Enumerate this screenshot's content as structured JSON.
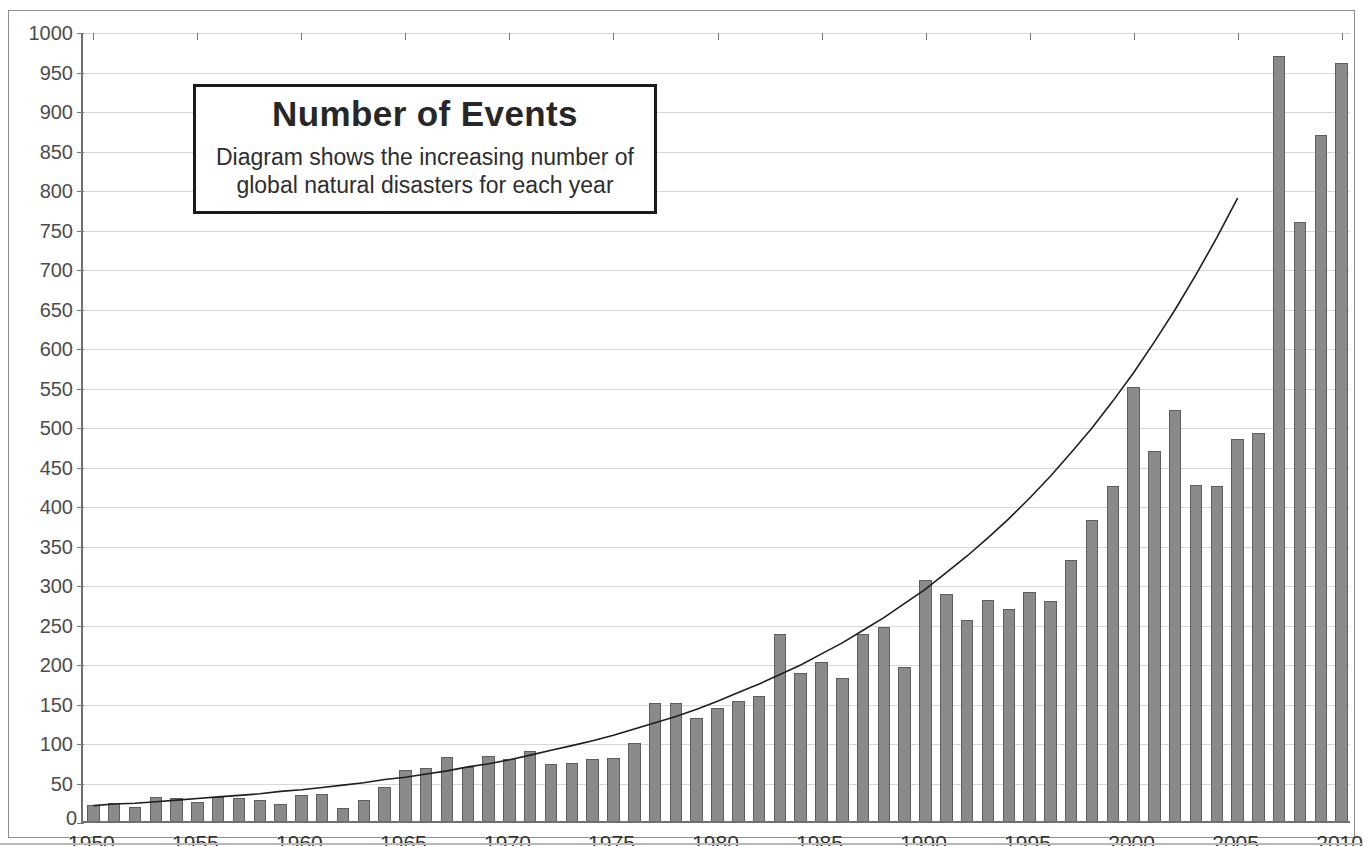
{
  "top_strip": {
    "clipped_text": ""
  },
  "title_box": {
    "title": "Number of Events",
    "subtitle_line1": "Diagram shows the increasing number of",
    "subtitle_line2": "global natural disasters for each year"
  },
  "colors": {
    "bar_fill": "#8a8a8a",
    "bar_edge": "#5e5e5e",
    "gridline": "#d8d8d8",
    "axis": "#6f6f6f",
    "trend_line": "#1e1e1e",
    "title_border": "#1b1b1b",
    "background": "#ffffff"
  },
  "chart_data": {
    "type": "bar",
    "title": "Number of Events",
    "subtitle": "Diagram shows the increasing number of global natural disasters for each year",
    "xlabel": "",
    "ylabel": "",
    "ylim": [
      0,
      1000
    ],
    "ytick_step": 50,
    "ytick_labels": [
      "0",
      "50",
      "100",
      "150",
      "200",
      "250",
      "300",
      "350",
      "400",
      "450",
      "500",
      "550",
      "600",
      "650",
      "700",
      "750",
      "800",
      "850",
      "900",
      "950",
      "1000"
    ],
    "xlim": [
      1950,
      2010
    ],
    "xtick_labels": [
      "1950",
      "1955",
      "1960",
      "1965",
      "1970",
      "1975",
      "1980",
      "1985",
      "1990",
      "1995",
      "2000",
      "2005",
      "2010"
    ],
    "xtick_step": 5,
    "grid": true,
    "legend": "none",
    "categories": [
      1950,
      1951,
      1952,
      1953,
      1954,
      1955,
      1956,
      1957,
      1958,
      1959,
      1960,
      1961,
      1962,
      1963,
      1964,
      1965,
      1966,
      1967,
      1968,
      1969,
      1970,
      1971,
      1972,
      1973,
      1974,
      1975,
      1976,
      1977,
      1978,
      1979,
      1980,
      1981,
      1982,
      1983,
      1984,
      1985,
      1986,
      1987,
      1988,
      1989,
      1990,
      1991,
      1992,
      1993,
      1994,
      1995,
      1996,
      1997,
      1998,
      1999,
      2000,
      2001,
      2002,
      2003,
      2004,
      2005,
      2006,
      2007,
      2008,
      2009,
      2010
    ],
    "values": [
      20,
      23,
      18,
      31,
      29,
      24,
      30,
      29,
      27,
      21,
      33,
      34,
      17,
      26,
      43,
      64,
      67,
      81,
      69,
      82,
      79,
      89,
      72,
      73,
      78,
      80,
      99,
      149,
      150,
      131,
      143,
      152,
      158,
      237,
      187,
      201,
      181,
      237,
      245,
      195,
      305,
      287,
      255,
      280,
      268,
      290,
      278,
      331,
      381,
      424,
      550,
      468,
      520,
      425,
      424,
      483,
      491,
      969,
      758,
      869,
      960
    ],
    "series": [
      {
        "name": "Number of events",
        "type": "bar",
        "values": [
          20,
          23,
          18,
          31,
          29,
          24,
          30,
          29,
          27,
          21,
          33,
          34,
          17,
          26,
          43,
          64,
          67,
          81,
          69,
          82,
          79,
          89,
          72,
          73,
          78,
          80,
          99,
          149,
          150,
          131,
          143,
          152,
          158,
          237,
          187,
          201,
          181,
          237,
          245,
          195,
          305,
          287,
          255,
          280,
          268,
          290,
          278,
          331,
          381,
          424,
          550,
          468,
          520,
          425,
          424,
          483,
          491,
          969,
          758,
          869,
          960
        ]
      },
      {
        "name": "Exponential trend",
        "type": "line",
        "values": [
          22,
          24,
          25,
          27,
          29,
          31,
          33,
          35,
          37,
          40,
          42,
          45,
          48,
          51,
          55,
          58,
          62,
          66,
          71,
          75,
          80,
          86,
          92,
          98,
          104,
          111,
          119,
          127,
          135,
          144,
          154,
          165,
          176,
          188,
          200,
          214,
          228,
          244,
          260,
          278,
          296,
          317,
          338,
          361,
          385,
          411,
          439,
          469,
          500,
          534,
          570,
          609,
          650,
          694,
          741,
          791,
          845,
          902,
          963,
          1028,
          1098
        ],
        "clipped_at": 805
      }
    ],
    "annotations": [
      {
        "kind": "text-box",
        "title": "Number of Events",
        "text": "Diagram shows the increasing number of global natural disasters for each year",
        "position": "upper-left"
      }
    ]
  }
}
